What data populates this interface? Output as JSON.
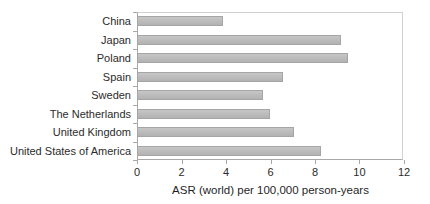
{
  "chart_data": {
    "type": "bar",
    "orientation": "horizontal",
    "title": "",
    "categories": [
      "China",
      "Japan",
      "Poland",
      "Spain",
      "Sweden",
      "The Netherlands",
      "United Kingdom",
      "United States of America"
    ],
    "values": [
      3.9,
      9.2,
      9.5,
      6.6,
      5.7,
      6.0,
      7.1,
      8.3
    ],
    "xlabel": "ASR (world) per 100,000 person-years",
    "ylabel": "",
    "xlim": [
      0,
      12
    ],
    "xticks": [
      0,
      2,
      4,
      6,
      8,
      10,
      12
    ],
    "grid": false,
    "legend": false,
    "colors": {
      "bar_fill": "#bcbcbc",
      "bar_border": "#a5a5a5",
      "axis_line": "#a8a8a8",
      "plot_border": "#d2d2d2",
      "text": "#2b2b2b",
      "background": "#ffffff"
    }
  }
}
